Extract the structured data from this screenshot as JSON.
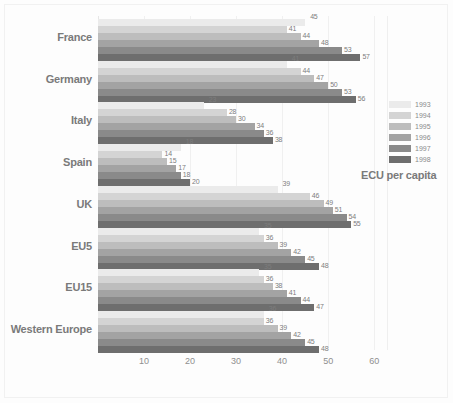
{
  "chart_data": {
    "type": "bar",
    "orientation": "horizontal",
    "title": "",
    "xlabel": "",
    "ylabel": "",
    "unit_label": "ECU per capita",
    "xlim": [
      0,
      63
    ],
    "xticks": [
      10,
      20,
      30,
      40,
      50,
      60
    ],
    "grid": true,
    "legend_position": "right",
    "categories": [
      "France",
      "Germany",
      "Italy",
      "Spain",
      "UK",
      "EU5",
      "EU15",
      "Western Europe"
    ],
    "series": [
      {
        "name": "1993",
        "color": "#ebebeb",
        "values": [
          45,
          41,
          23,
          18,
          39,
          35,
          35,
          36
        ]
      },
      {
        "name": "1994",
        "color": "#d4d4d4",
        "values": [
          41,
          44,
          28,
          14,
          46,
          36,
          36,
          36
        ]
      },
      {
        "name": "1995",
        "color": "#bdbdbd",
        "values": [
          44,
          47,
          30,
          15,
          49,
          39,
          38,
          39
        ]
      },
      {
        "name": "1996",
        "color": "#a3a3a3",
        "values": [
          48,
          50,
          34,
          17,
          51,
          42,
          41,
          42
        ]
      },
      {
        "name": "1997",
        "color": "#8a8a8a",
        "values": [
          53,
          53,
          36,
          18,
          54,
          45,
          44,
          45
        ]
      },
      {
        "name": "1998",
        "color": "#6e6e6e",
        "values": [
          57,
          56,
          38,
          20,
          55,
          48,
          47,
          48
        ]
      }
    ]
  },
  "legend": {
    "title": "ECU per capita"
  },
  "colors": {
    "background": "#fdfdfd",
    "gridline": "#f0f0f0",
    "label_text": "#7d7d7d",
    "category_text": "#7a7a7a",
    "tick_text": "#8f8f8f"
  }
}
